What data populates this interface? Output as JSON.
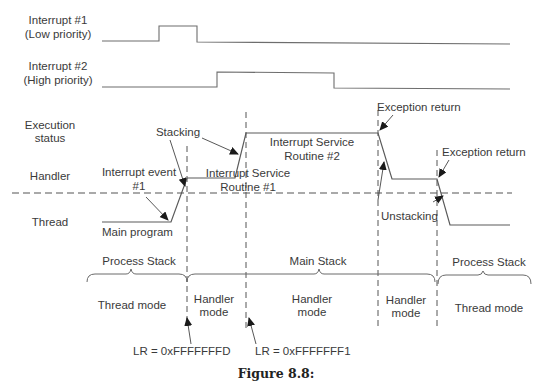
{
  "figure": {
    "caption": "Figure 8.8:",
    "signals": [
      {
        "name": "interrupt-1",
        "label_line1": "Interrupt #1",
        "label_line2": "(Low priority)"
      },
      {
        "name": "interrupt-2",
        "label_line1": "Interrupt #2",
        "label_line2": "(High priority)"
      }
    ],
    "row_labels": {
      "execution_status_line1": "Execution",
      "execution_status_line2": "status",
      "handler": "Handler",
      "thread": "Thread"
    },
    "annotations": {
      "stacking": "Stacking",
      "interrupt_event_line1": "Interrupt event",
      "interrupt_event_line2": "#1",
      "main_program": "Main program",
      "isr1_line1": "Interrupt Service",
      "isr1_line2": "Routine #1",
      "isr2_line1": "Interrupt Service",
      "isr2_line2": "Routine #2",
      "exception_return_1": "Exception return",
      "exception_return_2": "Exception return",
      "unstacking": "Unstacking"
    },
    "stacks": [
      {
        "label": "Process Stack"
      },
      {
        "label": "Main Stack"
      },
      {
        "label": "Process Stack"
      }
    ],
    "modes": [
      {
        "line1": "Thread mode",
        "line2": ""
      },
      {
        "line1": "Handler",
        "line2": "mode"
      },
      {
        "line1": "Handler",
        "line2": "mode"
      },
      {
        "line1": "Handler",
        "line2": "mode"
      },
      {
        "line1": "Thread mode",
        "line2": ""
      }
    ],
    "lr_values": {
      "first": "LR = 0xFFFFFFFD",
      "second": "LR = 0xFFFFFFF1"
    }
  }
}
